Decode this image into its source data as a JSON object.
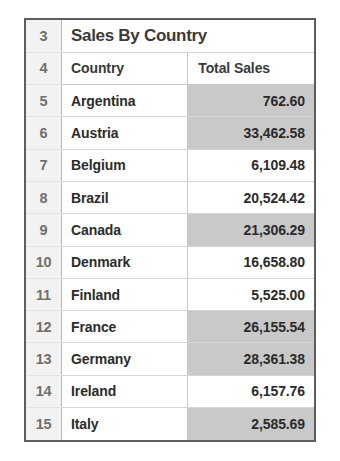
{
  "sheet": {
    "title": "Sales By Country",
    "title_row_number": "3",
    "header_row_number": "4",
    "columns": [
      "Country",
      "Total Sales"
    ],
    "rows": [
      {
        "row_number": "5",
        "country": "Argentina",
        "total_sales": "762.60",
        "banded": true
      },
      {
        "row_number": "6",
        "country": "Austria",
        "total_sales": "33,462.58",
        "banded": true
      },
      {
        "row_number": "7",
        "country": "Belgium",
        "total_sales": "6,109.48",
        "banded": false
      },
      {
        "row_number": "8",
        "country": "Brazil",
        "total_sales": "20,524.42",
        "banded": false
      },
      {
        "row_number": "9",
        "country": "Canada",
        "total_sales": "21,306.29",
        "banded": true
      },
      {
        "row_number": "10",
        "country": "Denmark",
        "total_sales": "16,658.80",
        "banded": false
      },
      {
        "row_number": "11",
        "country": "Finland",
        "total_sales": "5,525.00",
        "banded": false
      },
      {
        "row_number": "12",
        "country": "France",
        "total_sales": "26,155.54",
        "banded": true
      },
      {
        "row_number": "13",
        "country": "Germany",
        "total_sales": "28,361.38",
        "banded": true
      },
      {
        "row_number": "14",
        "country": "Ireland",
        "total_sales": "6,157.76",
        "banded": false
      },
      {
        "row_number": "15",
        "country": "Italy",
        "total_sales": "2,585.69",
        "banded": true
      }
    ]
  },
  "colors": {
    "frame_border": "#5d5d5d",
    "gutter_background": "#f2f2f2",
    "band_fill": "#c9c9c9",
    "grid_line": "#d5d5d5",
    "text": "#2b2b2b"
  }
}
